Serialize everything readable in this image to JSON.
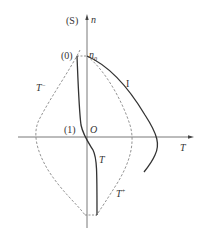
{
  "diagram": {
    "axes": {
      "vertical_label": "n",
      "horizontal_label": "T",
      "origin_label": "O",
      "vertical_axis_name": "(S)"
    },
    "points": {
      "p0_label": "(0)",
      "p1_label": "(1)",
      "n0_label": "n",
      "n0_sub": "0"
    },
    "curves": {
      "curve_I_label": "I",
      "curve_T_label": "T",
      "curve_Tminus_label": "T",
      "curve_Tminus_sup": "−",
      "curve_Tplus_label": "T",
      "curve_Tplus_sup": "+"
    },
    "colors": {
      "axis": "#555555",
      "solid_curve": "#333333",
      "dashed_curve": "#777777"
    }
  }
}
